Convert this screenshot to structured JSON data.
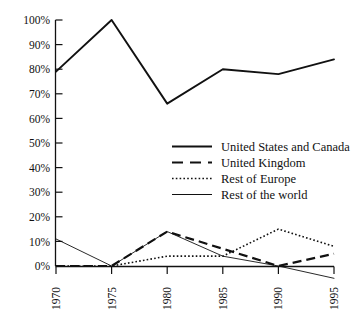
{
  "chart_data": {
    "type": "line",
    "title": "",
    "subtitle": "",
    "xlabel": "",
    "ylabel": "",
    "x": [
      1970,
      1975,
      1980,
      1985,
      1990,
      1995
    ],
    "categories": [
      "1970",
      "1975",
      "1980",
      "1985",
      "1990",
      "1995"
    ],
    "xtick_labels": [
      "1970",
      "1975",
      "1980",
      "1985",
      "1990",
      "1995"
    ],
    "ytick_labels": [
      "0%",
      "10%",
      "20%",
      "30%",
      "40%",
      "50%",
      "60%",
      "70%",
      "80%",
      "90%",
      "100%"
    ],
    "ytick_values": [
      0,
      10,
      20,
      30,
      40,
      50,
      60,
      70,
      80,
      90,
      100
    ],
    "ylim": [
      -6,
      100
    ],
    "xlim": [
      1970,
      1995
    ],
    "grid": false,
    "legend_position": "center-right-inside",
    "series": [
      {
        "name": "United States and Canada",
        "style": "solid-thick",
        "color": "#111111",
        "values": [
          79,
          100,
          66,
          80,
          78,
          84
        ]
      },
      {
        "name": "United Kingdom",
        "style": "dashed",
        "color": "#111111",
        "values": [
          0,
          0,
          14,
          7,
          0,
          5
        ]
      },
      {
        "name": "Rest of Europe",
        "style": "dotted",
        "color": "#111111",
        "values": [
          0,
          0,
          4,
          4,
          15,
          8
        ]
      },
      {
        "name": "Rest of the world",
        "style": "solid-thin",
        "color": "#111111",
        "values": [
          11,
          0,
          14,
          4,
          0,
          -5
        ]
      }
    ],
    "legend_entries": [
      {
        "label": "United States and Canada",
        "style": "solid-thick"
      },
      {
        "label": "United Kingdom",
        "style": "dashed"
      },
      {
        "label": "Rest of Europe",
        "style": "dotted"
      },
      {
        "label": "Rest of the world",
        "style": "solid-thin"
      }
    ]
  }
}
